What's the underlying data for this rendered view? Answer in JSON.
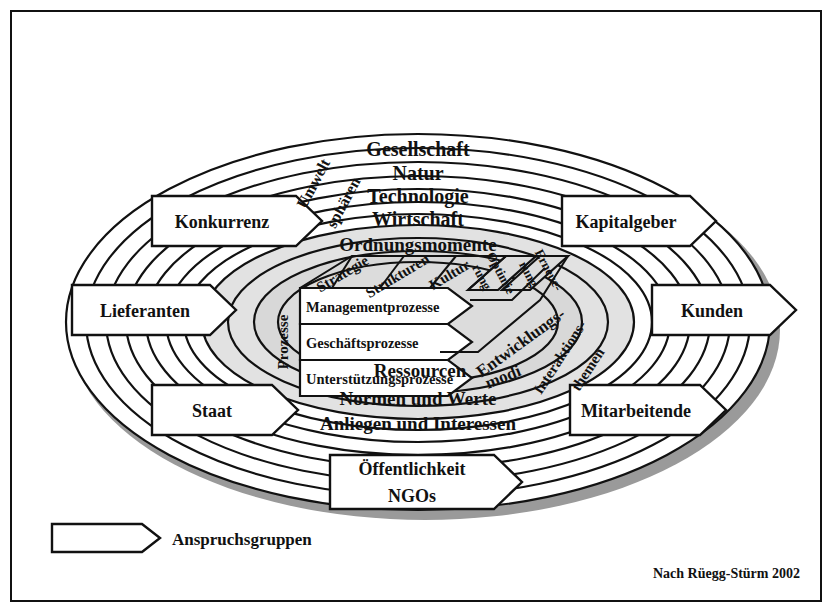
{
  "figure": {
    "attribution": "Nach Rüegg-Stürm 2002",
    "legend": {
      "label": "Anspruchsgruppen",
      "shape": "arrow-tag"
    }
  },
  "environment_spheres": {
    "group_label_line1": "Umwelt",
    "group_label_line2": "sphären",
    "items": [
      {
        "label": "Gesellschaft"
      },
      {
        "label": "Natur"
      },
      {
        "label": "Technologie"
      },
      {
        "label": "Wirtschaft"
      }
    ]
  },
  "interaction_themes": {
    "group_label_line1": "Interaktions-",
    "group_label_line2": "themen",
    "items": [
      {
        "label": "Normen und Werte"
      },
      {
        "label": "Anliegen und Interessen"
      },
      {
        "label": "Ressourcen"
      }
    ]
  },
  "ordnungsmomente": {
    "group_label": "Ordnungsmomente",
    "items": [
      {
        "label": "Strategie"
      },
      {
        "label": "Strukturen"
      },
      {
        "label": "Kultur"
      }
    ]
  },
  "prozesse": {
    "group_label": "Prozesse",
    "items": [
      {
        "label": "Managementprozesse"
      },
      {
        "label": "Geschäftsprozesse"
      },
      {
        "label": "Unterstützungsprozesse"
      }
    ]
  },
  "entwicklungsmodi": {
    "group_label_line1": "Entwicklungs-",
    "group_label_line2": "modi",
    "items": [
      {
        "label_line1": "Optimie",
        "label_line2": "rung",
        "full": "Optimierung"
      },
      {
        "label_line1": "Erneue-",
        "label_line2": "rung",
        "full": "Erneuerung"
      }
    ]
  },
  "stakeholders": {
    "left": [
      {
        "label": "Konkurrenz"
      },
      {
        "label": "Lieferanten"
      },
      {
        "label": "Staat"
      }
    ],
    "right": [
      {
        "label": "Kapitalgeber"
      },
      {
        "label": "Kunden"
      },
      {
        "label": "Mitarbeitende"
      }
    ],
    "bottom": [
      {
        "label": "Öffentlichkeit"
      },
      {
        "label": "NGOs"
      }
    ]
  },
  "colors": {
    "outline": "#111111",
    "ring_outer_fill": "#ffffff",
    "ring_inner_fill": "#dcdcdc",
    "shadow": "#9a9a9a",
    "page": "#ffffff"
  }
}
